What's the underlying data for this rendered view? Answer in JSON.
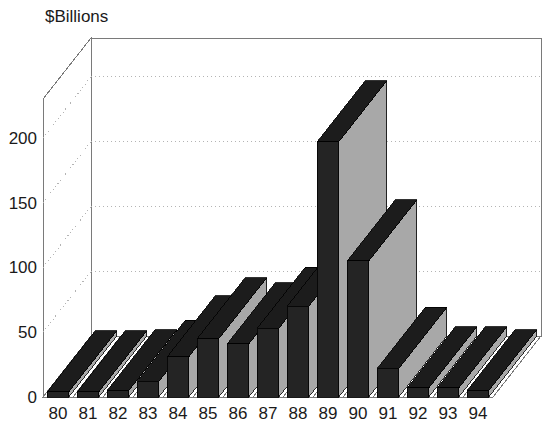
{
  "chart_data": {
    "type": "bar",
    "title": "",
    "ylabel": "$Billions",
    "xlabel": "",
    "categories": [
      "80",
      "81",
      "82",
      "83",
      "84",
      "85",
      "86",
      "87",
      "88",
      "89",
      "90",
      "91",
      "92",
      "93",
      "94"
    ],
    "values": [
      4,
      4,
      5,
      12,
      31,
      45,
      41,
      53,
      70,
      197,
      105,
      22,
      7,
      7,
      5
    ],
    "ylim": [
      0,
      200
    ],
    "yticks": [
      0,
      50,
      100,
      150,
      200
    ],
    "ytick_labels": [
      "0",
      "50",
      "100",
      "150",
      "200"
    ],
    "grid": true,
    "gridlines_at": [
      50,
      100,
      150,
      200
    ],
    "legend": "none",
    "three_d": true,
    "bar_face_color": "#242424",
    "bar_side_color": "#a8a8a8",
    "bar_top_color": "#1c1c1c",
    "axis_color": "#7a7a7a",
    "grid_color": "#b4b4b4",
    "background": "#ffffff",
    "text_color": "#1a1a1a"
  },
  "axis": {
    "y_title": "$Billions",
    "y_ticks": [
      "200",
      "150",
      "100",
      "50",
      "0"
    ],
    "x_ticks": [
      "80",
      "81",
      "82",
      "83",
      "84",
      "85",
      "86",
      "87",
      "88",
      "89",
      "90",
      "91",
      "92",
      "93",
      "94"
    ]
  }
}
